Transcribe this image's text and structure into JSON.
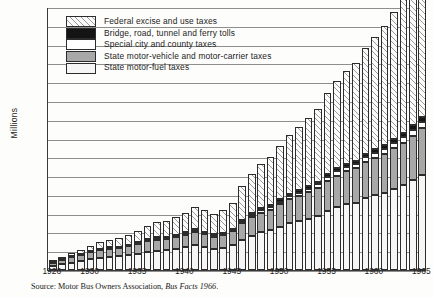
{
  "axis": {
    "ylabel": "Millions",
    "yticks": [
      "0",
      "1,000",
      "2,000",
      "3,000",
      "4,000",
      "5,000",
      "6,000",
      "7,000",
      "8,000",
      "9,000",
      "10,000",
      "11,000",
      "12,000",
      "13,000",
      "14,000"
    ],
    "xticks": [
      "1926",
      "1930",
      "1935",
      "1940",
      "1945",
      "1950",
      "1955",
      "1960",
      "1965"
    ]
  },
  "legend": {
    "items": [
      {
        "label": "Federal excise and use taxes",
        "swatch": "federal",
        "color": "#fbfbfb"
      },
      {
        "label": "Bridge, road, tunnel and ferry tolls",
        "swatch": "bridge",
        "color": "#141414"
      },
      {
        "label": "Special city and county taxes",
        "swatch": "special",
        "color": "#ffffff"
      },
      {
        "label": "State motor-vehicle and motor-carrier taxes",
        "swatch": "vehicle",
        "color": "#a8a8a8"
      },
      {
        "label": "State motor-fuel taxes",
        "swatch": "fuel",
        "color": "#f4f4f4"
      }
    ]
  },
  "source": {
    "prefix": "Source: Motor Bus Owners Association, ",
    "italic": "Bus Facts 1966",
    "suffix": "."
  },
  "chart_data": {
    "type": "bar",
    "stacked": true,
    "title": "",
    "xlabel": "",
    "ylabel": "Millions",
    "ylim": [
      0,
      14000
    ],
    "ytick_step": 1000,
    "grid": true,
    "legend_position": "top-left",
    "categories": [
      "1926",
      "1927",
      "1928",
      "1929",
      "1930",
      "1931",
      "1932",
      "1933",
      "1934",
      "1935",
      "1936",
      "1937",
      "1938",
      "1939",
      "1940",
      "1941",
      "1942",
      "1943",
      "1944",
      "1945",
      "1946",
      "1947",
      "1948",
      "1949",
      "1950",
      "1951",
      "1952",
      "1953",
      "1954",
      "1955",
      "1956",
      "1957",
      "1958",
      "1959",
      "1960",
      "1961",
      "1962",
      "1963",
      "1964",
      "1965"
    ],
    "series": [
      {
        "name": "State motor-fuel taxes",
        "values": [
          220,
          300,
          390,
          470,
          560,
          640,
          690,
          720,
          790,
          870,
          960,
          1030,
          1060,
          1130,
          1210,
          1330,
          1230,
          1130,
          1190,
          1320,
          1620,
          1830,
          2000,
          2110,
          2300,
          2480,
          2600,
          2740,
          2880,
          3130,
          3330,
          3490,
          3590,
          3820,
          3980,
          4120,
          4330,
          4530,
          4790,
          5060
        ]
      },
      {
        "name": "State motor-vehicle and motor-carrier taxes",
        "values": [
          170,
          220,
          280,
          330,
          380,
          420,
          430,
          430,
          470,
          510,
          560,
          590,
          600,
          630,
          670,
          720,
          680,
          640,
          670,
          740,
          880,
          980,
          1060,
          1110,
          1200,
          1290,
          1350,
          1420,
          1490,
          1610,
          1700,
          1770,
          1820,
          1930,
          2000,
          2060,
          2160,
          2250,
          2370,
          2490
        ]
      },
      {
        "name": "Special city and county taxes",
        "values": [
          20,
          25,
          30,
          35,
          40,
          45,
          45,
          45,
          50,
          55,
          60,
          65,
          65,
          70,
          75,
          80,
          75,
          70,
          75,
          85,
          100,
          115,
          125,
          135,
          145,
          155,
          165,
          175,
          185,
          200,
          215,
          225,
          235,
          250,
          260,
          270,
          285,
          300,
          315,
          335
        ]
      },
      {
        "name": "Bridge, road, tunnel and ferry tolls",
        "values": [
          15,
          18,
          22,
          26,
          30,
          33,
          34,
          34,
          37,
          41,
          45,
          48,
          49,
          52,
          56,
          61,
          57,
          53,
          56,
          63,
          76,
          86,
          95,
          102,
          111,
          120,
          127,
          135,
          143,
          155,
          166,
          175,
          182,
          194,
          203,
          211,
          223,
          234,
          247,
          262
        ]
      },
      {
        "name": "Federal excise and use taxes",
        "values": [
          75,
          110,
          160,
          220,
          290,
          360,
          410,
          450,
          530,
          620,
          720,
          800,
          840,
          930,
          1030,
          1180,
          1130,
          1080,
          1180,
          1370,
          1780,
          2090,
          2360,
          2540,
          2840,
          3150,
          3380,
          3640,
          3900,
          4320,
          4660,
          4950,
          5180,
          5640,
          5980,
          6310,
          6760,
          7200,
          7730,
          8240
        ]
      }
    ],
    "totals": [
      500,
      673,
      882,
      1081,
      1300,
      1498,
      1609,
      1679,
      1877,
      2096,
      2345,
      2533,
      2614,
      2812,
      3041,
      3371,
      3172,
      2973,
      3171,
      3578,
      4456,
      5101,
      5640,
      5997,
      6596,
      7195,
      7622,
      8110,
      8598,
      9415,
      10071,
      10610,
      11007,
      11834,
      12423,
      12971,
      13758,
      14514,
      15452,
      16387
    ]
  }
}
